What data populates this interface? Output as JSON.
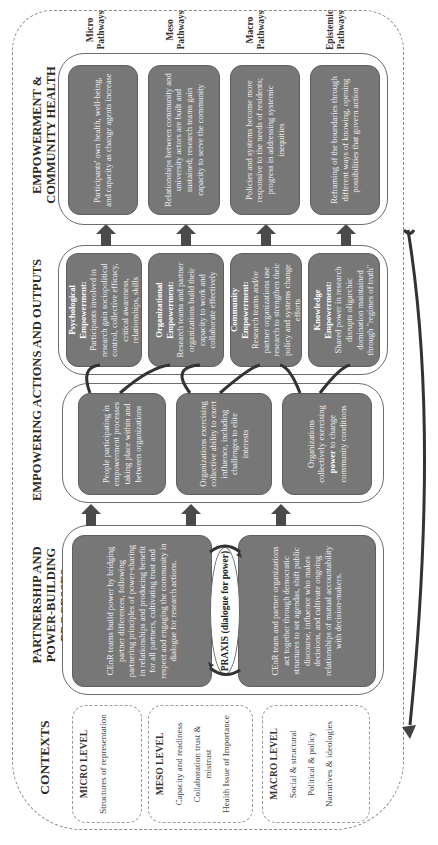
{
  "headers": {
    "contexts": "CONTEXTS",
    "partnership": "PARTNERSHIP AND POWER-BUILDING PROCESSES",
    "empowering": "EMPOWERING ACTIONS AND OUTPUTS",
    "outcomes": "EMPOWERMENT & COMMUNITY HEALTH OUTCOMES"
  },
  "contexts": [
    {
      "level": "MICRO LEVEL",
      "items": [
        "Structures of representation"
      ]
    },
    {
      "level": "MESO LEVEL",
      "items": [
        "Capacity and readiness",
        "Collaboration trust & mistrust",
        "Health Issue of Importance"
      ]
    },
    {
      "level": "MACRO LEVEL",
      "items": [
        "Social & structural",
        "Political & policy",
        "Narratives & ideologies"
      ]
    }
  ],
  "partnership": {
    "top_box": "CEnR teams build power by bridging partner differences, following partnering principles of power-sharing in relationships and producing benefit for all partners, cultivating trust and respect and engaging the community in dialogue for research actions.",
    "praxis": "PRAXIS (dialogue for power)",
    "bottom_box": "CEnR team and partner organizations act together through democratic structures to set agendas, shift public discourse, influence who makes decisions, and cultivate ongoing relationships of mutual accountability with decision-makers."
  },
  "empowering": {
    "actions": [
      {
        "text": "People participating in empowerment processes taking place within and between organizations"
      },
      {
        "text": "Organizations exercising collective ability to exert influence, including challenges to elite interests"
      },
      {
        "text_pre": "Organizations collectively exercising ",
        "text_bold": "power",
        "text_post": " to change community conditions"
      }
    ],
    "outputs": [
      {
        "title": "Psychological Empowerment:",
        "text": "Participants involved in research gain sociopolitical control, collective efficacy, critical awareness, relationships, skills"
      },
      {
        "title": "Organizational Empowerment:",
        "text": "Research teams and partner organizations build their capacity to work and collaborate effectively"
      },
      {
        "title": "Community Empowerment:",
        "text": "Research teams and/or partner organizations use research to strengthen their policy and systems change efforts"
      },
      {
        "title": "Knowledge Empowerment:",
        "text": "Shared power in research disrupts oligarchic domination maintained through \"regimes of truth\""
      }
    ]
  },
  "outcomes": [
    {
      "text": "Participants' own health, well-being, and capacity as change agents increase",
      "pathway": "Micro Pathways"
    },
    {
      "text": "Relationships between community and university actors are built and sustained; research teams gain capacity to serve the community",
      "pathway": "Meso Pathways"
    },
    {
      "text": "Policies and systems become more responsive to the needs of residents; progress in addressing systemic inequities",
      "pathway": "Macro Pathways"
    },
    {
      "text": "Reframing of the boundaries through different ways of knowing, opening possibilities that govern action",
      "pathway": "Epistemic Pathways"
    }
  ],
  "colors": {
    "box_fill": "#777777",
    "arrow": "#4a4a4a",
    "dashed_border": "#8a8a8a"
  }
}
